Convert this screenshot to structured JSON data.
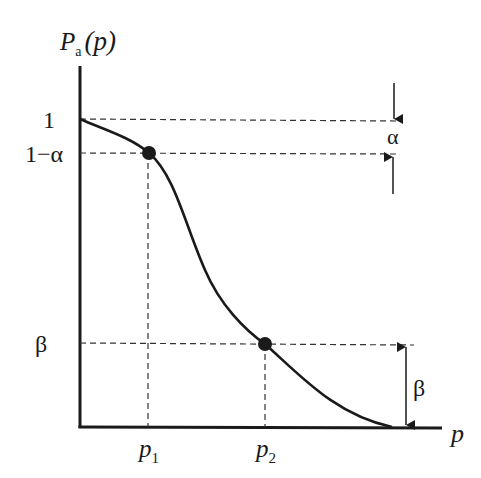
{
  "diagram": {
    "type": "operating-characteristic-curve",
    "y_axis_label": {
      "main": "P",
      "subscript": "a",
      "arg": "(p)"
    },
    "x_axis_label": "p",
    "y_ticks": [
      {
        "label": "1",
        "value": 1.0
      },
      {
        "label": "1−α",
        "value": "1-alpha"
      },
      {
        "label": "β",
        "value": "beta"
      }
    ],
    "x_ticks": [
      {
        "label": "p",
        "subscript": "1"
      },
      {
        "label": "p",
        "subscript": "2"
      }
    ],
    "points": [
      {
        "name": "p1",
        "at": "(p1, 1−α)"
      },
      {
        "name": "p2",
        "at": "(p2, β)"
      }
    ],
    "annotations": {
      "alpha_gap_label": "α",
      "beta_gap_label": "β"
    },
    "colors": {
      "ink": "#1a1a1a",
      "background": "#ffffff"
    }
  }
}
